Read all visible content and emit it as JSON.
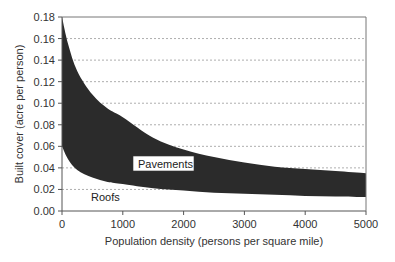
{
  "chart_data": {
    "type": "area",
    "title": "",
    "xlabel": "Population density (persons per square mile)",
    "ylabel": "Built cover (acre per person)",
    "xlim": [
      0,
      5000
    ],
    "ylim": [
      0,
      0.18
    ],
    "xticks": [
      "0",
      "1000",
      "2000",
      "3000",
      "4000",
      "5000"
    ],
    "yticks": [
      "0.00",
      "0.02",
      "0.04",
      "0.06",
      "0.08",
      "0.10",
      "0.12",
      "0.14",
      "0.16",
      "0.18"
    ],
    "grid": "horizontal dashed",
    "x": [
      0,
      100,
      250,
      500,
      750,
      1000,
      1500,
      2000,
      2500,
      3000,
      3500,
      4000,
      4500,
      5000
    ],
    "series": [
      {
        "name": "Roofs",
        "description": "lower boundary curve (roof cover per person)",
        "values": [
          0.06,
          0.048,
          0.038,
          0.031,
          0.027,
          0.025,
          0.021,
          0.019,
          0.017,
          0.016,
          0.015,
          0.014,
          0.0135,
          0.013
        ]
      },
      {
        "name": "Pavements",
        "description": "upper boundary curve (total built cover per person); band between curves = pavements",
        "values": [
          0.18,
          0.155,
          0.13,
          0.108,
          0.095,
          0.087,
          0.068,
          0.057,
          0.05,
          0.045,
          0.041,
          0.039,
          0.037,
          0.035
        ]
      }
    ],
    "annotations": [
      {
        "text": "Pavements",
        "x": 1450,
        "y": 0.045
      },
      {
        "text": "Roofs",
        "x": 700,
        "y": 0.012
      }
    ],
    "fill_color": "#2b2b2b"
  },
  "labels": {
    "pavements": "Pavements",
    "roofs": "Roofs",
    "xlabel": "Population density (persons per square mile)",
    "ylabel": "Built cover (acre per person)"
  }
}
